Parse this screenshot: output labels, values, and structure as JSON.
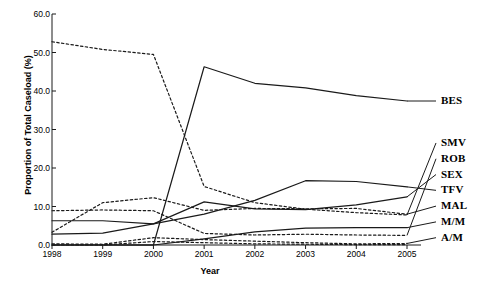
{
  "chart_data": {
    "type": "line",
    "title": "",
    "xlabel": "Year",
    "ylabel": "Proportion of Total Caseload (%)",
    "x": [
      1998,
      1999,
      2000,
      2001,
      2002,
      2003,
      2004,
      2005
    ],
    "xtick_labels": [
      "1998",
      "1999",
      "2000",
      "2001",
      "2002",
      "2003",
      "2004",
      "2005"
    ],
    "ytick_labels": [
      "0.0",
      "10.0",
      "20.0",
      "30.0",
      "40.0",
      "50.0",
      "60.0"
    ],
    "ytick_values": [
      0.0,
      10.0,
      20.0,
      30.0,
      40.0,
      50.0,
      60.0
    ],
    "ylim": [
      0.0,
      60.0
    ],
    "xlim": [
      1998,
      2005
    ],
    "grid": false,
    "legend_position": "right-outside-leader-lines",
    "series": [
      {
        "name": "BES",
        "label": "BES",
        "style": "solid",
        "color": "#1a1a1a",
        "values": [
          0.0,
          0.0,
          0.0,
          46.3,
          42.0,
          40.8,
          38.8,
          37.4
        ]
      },
      {
        "name": "SMV",
        "label": "SMV",
        "style": "dashed",
        "color": "#1a1a1a",
        "values": [
          52.8,
          50.8,
          49.5,
          15.2,
          11.0,
          9.3,
          8.4,
          7.8
        ]
      },
      {
        "name": "ROB",
        "label": "ROB",
        "style": "dashed",
        "color": "#1a1a1a",
        "values": [
          8.9,
          9.1,
          8.9,
          3.0,
          2.6,
          2.8,
          2.6,
          2.5
        ]
      },
      {
        "name": "SEX",
        "label": "SEX",
        "style": "solid",
        "color": "#1a1a1a",
        "values": [
          6.3,
          6.3,
          5.5,
          11.2,
          9.4,
          9.2,
          10.4,
          12.5
        ]
      },
      {
        "name": "TFV",
        "label": "TFV",
        "style": "solid",
        "color": "#1a1a1a",
        "values": [
          2.8,
          3.1,
          5.5,
          8.0,
          11.6,
          16.7,
          16.5,
          15.1
        ]
      },
      {
        "name": "MAL",
        "label": "MAL",
        "style": "dashed",
        "color": "#1a1a1a",
        "values": [
          3.3,
          11.0,
          12.3,
          9.0,
          9.5,
          9.4,
          9.5,
          8.0
        ]
      },
      {
        "name": "M/M",
        "label": "M/M",
        "style": "solid",
        "color": "#1a1a1a",
        "values": [
          0.0,
          0.0,
          0.0,
          1.6,
          3.4,
          4.4,
          4.5,
          4.5
        ]
      },
      {
        "name": "A/M",
        "label": "A/M",
        "style": "dashed",
        "color": "#1a1a1a",
        "values": [
          0.3,
          0.2,
          1.9,
          1.4,
          1.0,
          0.6,
          0.3,
          0.4
        ]
      },
      {
        "name": "A/M-low",
        "label": "",
        "style": "dashed",
        "color": "#1a1a1a",
        "values": [
          0.0,
          0.0,
          0.9,
          0.6,
          0.3,
          0.2,
          0.1,
          0.1
        ]
      }
    ],
    "legend_entries": [
      {
        "label": "BES",
        "y_value": 37.4
      },
      {
        "label": "SMV",
        "y_value": 26.5
      },
      {
        "label": "ROB",
        "y_value": 22.4
      },
      {
        "label": "SEX",
        "y_value": 18.3
      },
      {
        "label": "TFV",
        "y_value": 14.2
      },
      {
        "label": "MAL",
        "y_value": 10.1
      },
      {
        "label": "M/M",
        "y_value": 6.0
      },
      {
        "label": "A/M",
        "y_value": 1.9
      }
    ]
  }
}
